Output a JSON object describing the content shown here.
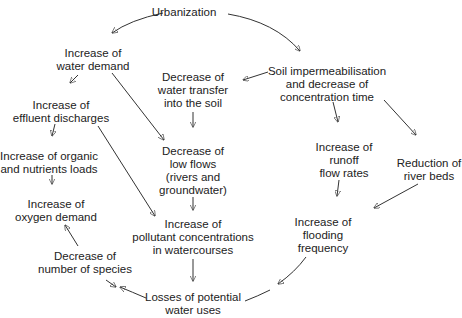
{
  "diagram": {
    "type": "causal-flow",
    "nodes": [
      {
        "id": "urbanization",
        "lines": [
          "Urbanization"
        ],
        "x": 184,
        "y": 6
      },
      {
        "id": "water-demand",
        "lines": [
          "Increase of",
          "water demand"
        ],
        "x": 93,
        "y": 47
      },
      {
        "id": "effluent",
        "lines": [
          "Increase of",
          "effluent discharges"
        ],
        "x": 61,
        "y": 99
      },
      {
        "id": "organic-loads",
        "lines": [
          "Increase of organic",
          "and nutrients loads"
        ],
        "x": 49,
        "y": 150
      },
      {
        "id": "oxygen-demand",
        "lines": [
          "Increase of",
          "oxygen demand"
        ],
        "x": 56,
        "y": 198
      },
      {
        "id": "species",
        "lines": [
          "Decrease of",
          "number of species"
        ],
        "x": 85,
        "y": 250
      },
      {
        "id": "water-transfer",
        "lines": [
          "Decrease of",
          "water transfer",
          "into the soil"
        ],
        "x": 193,
        "y": 71
      },
      {
        "id": "low-flows",
        "lines": [
          "Decrease of",
          "low flows",
          "(rivers and",
          "groundwater)"
        ],
        "x": 193,
        "y": 147
      },
      {
        "id": "pollutant",
        "lines": [
          "Increase of",
          "pollutant concentrations",
          "in watercourses"
        ],
        "x": 193,
        "y": 220
      },
      {
        "id": "losses",
        "lines": [
          "Losses of potential",
          "water uses"
        ],
        "x": 193,
        "y": 292
      },
      {
        "id": "soil-imperm",
        "lines": [
          "Soil impermeabilisation",
          "and decrease of",
          "concentration time"
        ],
        "x": 327,
        "y": 65
      },
      {
        "id": "runoff",
        "lines": [
          "Increase of",
          "runoff",
          "flow rates"
        ],
        "x": 344,
        "y": 141
      },
      {
        "id": "river-beds",
        "lines": [
          "Reduction of",
          "river beds"
        ],
        "x": 429,
        "y": 162
      },
      {
        "id": "flooding",
        "lines": [
          "Increase of",
          "flooding",
          "frequency"
        ],
        "x": 323,
        "y": 216
      }
    ],
    "edges": [
      {
        "from": "urbanization",
        "to": "water-demand"
      },
      {
        "from": "urbanization",
        "to": "soil-imperm"
      },
      {
        "from": "water-demand",
        "to": "effluent"
      },
      {
        "from": "water-demand",
        "to": "low-flows"
      },
      {
        "from": "effluent",
        "to": "organic-loads"
      },
      {
        "from": "effluent",
        "to": "pollutant"
      },
      {
        "from": "organic-loads",
        "to": "oxygen-demand"
      },
      {
        "from": "oxygen-demand",
        "to": "species"
      },
      {
        "from": "species",
        "to": "losses"
      },
      {
        "from": "soil-imperm",
        "to": "water-transfer"
      },
      {
        "from": "soil-imperm",
        "to": "runoff"
      },
      {
        "from": "soil-imperm",
        "to": "river-beds"
      },
      {
        "from": "water-transfer",
        "to": "low-flows"
      },
      {
        "from": "low-flows",
        "to": "pollutant"
      },
      {
        "from": "pollutant",
        "to": "losses"
      },
      {
        "from": "runoff",
        "to": "flooding"
      },
      {
        "from": "river-beds",
        "to": "flooding"
      },
      {
        "from": "flooding",
        "to": "losses"
      },
      {
        "from": "losses",
        "to": "species"
      }
    ]
  }
}
